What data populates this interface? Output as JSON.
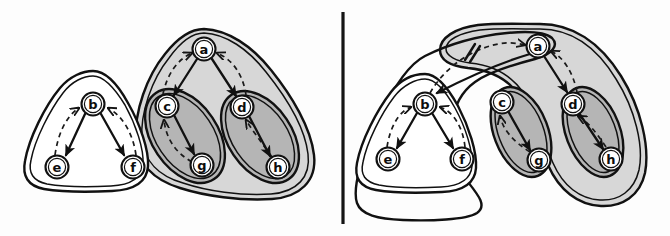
{
  "figure": {
    "width": 670,
    "height": 236,
    "background_color": "#fdfdfd",
    "divider": {
      "name": "panel-divider",
      "orientation": "vertical",
      "x": 343,
      "y1": 12,
      "y2": 224,
      "color": "#141414"
    }
  },
  "palette": {
    "ink": "#111111",
    "white": "#ffffff",
    "light_gray_fill": "#d7d7d7",
    "mid_gray_fill": "#b5b5b5",
    "page": "#fdfdfd"
  },
  "panels": [
    {
      "id": "left",
      "name": "left-panel",
      "label": "",
      "nodes": [
        {
          "id": "b",
          "label": "b",
          "cx": 93,
          "cy": 104
        },
        {
          "id": "e",
          "label": "e",
          "cx": 57,
          "cy": 167
        },
        {
          "id": "f",
          "label": "f",
          "cx": 133,
          "cy": 167
        },
        {
          "id": "a",
          "label": "a",
          "cx": 204,
          "cy": 49
        },
        {
          "id": "c",
          "label": "c",
          "cx": 167,
          "cy": 106
        },
        {
          "id": "d",
          "label": "d",
          "cx": 242,
          "cy": 107
        },
        {
          "id": "g",
          "label": "g",
          "cx": 202,
          "cy": 165
        },
        {
          "id": "h",
          "label": "h",
          "cx": 278,
          "cy": 167
        }
      ],
      "solid_edges": [
        {
          "from": "b",
          "to": "e"
        },
        {
          "from": "b",
          "to": "f"
        },
        {
          "from": "a",
          "to": "c"
        },
        {
          "from": "a",
          "to": "d"
        },
        {
          "from": "c",
          "to": "g"
        },
        {
          "from": "d",
          "to": "h"
        }
      ],
      "dashed_edges": [
        {
          "from": "e",
          "to": "b"
        },
        {
          "from": "f",
          "to": "b"
        },
        {
          "from": "c",
          "to": "a"
        },
        {
          "from": "d",
          "to": "a"
        },
        {
          "from": "g",
          "to": "c"
        },
        {
          "from": "h",
          "to": "d"
        }
      ],
      "regions": [
        {
          "id": "L-bef",
          "name": "region-b-e-f",
          "fill": "#ffffff",
          "contains": [
            "b",
            "e",
            "f"
          ]
        },
        {
          "id": "L-acdgh",
          "name": "region-a-c-d-g-h",
          "fill": "#d7d7d7",
          "contains": [
            "a",
            "c",
            "d",
            "g",
            "h"
          ]
        },
        {
          "id": "L-cg",
          "name": "region-c-g",
          "fill": "#b5b5b5",
          "contains": [
            "c",
            "g"
          ]
        },
        {
          "id": "L-dh",
          "name": "region-d-h",
          "fill": "#b5b5b5",
          "contains": [
            "d",
            "h"
          ]
        }
      ],
      "cut_marks": []
    },
    {
      "id": "right",
      "name": "right-panel",
      "label": "",
      "nodes": [
        {
          "id": "a",
          "label": "a",
          "cx": 538,
          "cy": 46
        },
        {
          "id": "b",
          "label": "b",
          "cx": 425,
          "cy": 104
        },
        {
          "id": "e",
          "label": "e",
          "cx": 388,
          "cy": 159
        },
        {
          "id": "f",
          "label": "f",
          "cx": 462,
          "cy": 159
        },
        {
          "id": "c",
          "label": "c",
          "cx": 502,
          "cy": 102
        },
        {
          "id": "d",
          "label": "d",
          "cx": 573,
          "cy": 104
        },
        {
          "id": "g",
          "label": "g",
          "cx": 539,
          "cy": 160
        },
        {
          "id": "h",
          "label": "h",
          "cx": 611,
          "cy": 159
        }
      ],
      "solid_edges": [
        {
          "from": "b",
          "to": "e"
        },
        {
          "from": "b",
          "to": "f"
        },
        {
          "from": "a",
          "to": "b"
        },
        {
          "from": "a",
          "to": "d"
        },
        {
          "from": "c",
          "to": "g"
        },
        {
          "from": "d",
          "to": "h"
        }
      ],
      "dashed_edges": [
        {
          "from": "e",
          "to": "b"
        },
        {
          "from": "f",
          "to": "b"
        },
        {
          "from": "b",
          "to": "a"
        },
        {
          "from": "d",
          "to": "a"
        },
        {
          "from": "g",
          "to": "c"
        },
        {
          "from": "h",
          "to": "d"
        }
      ],
      "regions": [
        {
          "id": "R-outer",
          "name": "region-outer-a-b-e-f",
          "fill": "#ffffff",
          "contains": [
            "a",
            "b",
            "e",
            "f"
          ]
        },
        {
          "id": "R-bef",
          "name": "region-b-e-f",
          "fill": "#ffffff",
          "contains": [
            "b",
            "e",
            "f"
          ]
        },
        {
          "id": "R-adgh",
          "name": "region-a-c-d-g-h",
          "fill": "#d7d7d7",
          "contains": [
            "a",
            "c",
            "g",
            "d",
            "h"
          ]
        },
        {
          "id": "R-cg",
          "name": "region-c-g",
          "fill": "#b5b5b5",
          "contains": [
            "c",
            "g"
          ]
        },
        {
          "id": "R-dh",
          "name": "region-d-h",
          "fill": "#b5b5b5",
          "contains": [
            "d",
            "h"
          ]
        }
      ],
      "cut_marks": [
        {
          "id": "cut-ba",
          "name": "edge-cut-mark",
          "x": 470,
          "y": 52,
          "symbol": "double-slash-strike"
        }
      ]
    }
  ]
}
